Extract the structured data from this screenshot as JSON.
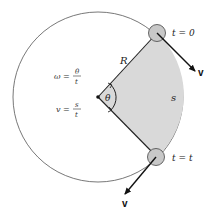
{
  "diagram": {
    "labels": {
      "radius": "R",
      "angle": "θ",
      "arc": "s",
      "start_time": "t = 0",
      "end_time": "t = t",
      "velocity_top": "v",
      "velocity_bottom": "v"
    },
    "equations": {
      "omega": {
        "lhs": "ω =",
        "num": "θ",
        "den": "t"
      },
      "velocity": {
        "lhs": "v =",
        "num": "s",
        "den": "t"
      }
    },
    "colors": {
      "sector_fill": "#d9d9d9",
      "ball_fill": "#c8c8c8",
      "line": "#222222",
      "circle": "#555555"
    }
  }
}
